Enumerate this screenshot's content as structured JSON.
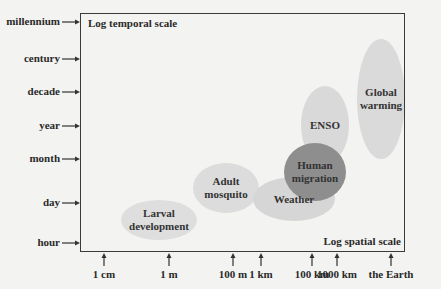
{
  "chart_data": {
    "type": "diagram",
    "title": "",
    "xlabel": "Log spatial scale",
    "ylabel": "Log temporal scale",
    "x_ticks": [
      {
        "label": "1 cm",
        "x": 104
      },
      {
        "label": "1 m",
        "x": 169
      },
      {
        "label": "100 m",
        "x": 233
      },
      {
        "label": "1 km",
        "x": 261
      },
      {
        "label": "100 km",
        "x": 312
      },
      {
        "label": "1000 km",
        "x": 337
      },
      {
        "label": "the Earth",
        "x": 391
      }
    ],
    "y_ticks": [
      {
        "label": "millennium",
        "y": 22
      },
      {
        "label": "century",
        "y": 59
      },
      {
        "label": "decade",
        "y": 92
      },
      {
        "label": "year",
        "y": 126
      },
      {
        "label": "month",
        "y": 159
      },
      {
        "label": "day",
        "y": 203
      },
      {
        "label": "hour",
        "y": 243
      }
    ],
    "regions": [
      {
        "label": "Larval development",
        "lines": [
          "Larval",
          "development"
        ],
        "cx": 159,
        "cy": 220,
        "rx": 38,
        "ry": 20,
        "fill": "#dedede"
      },
      {
        "label": "Adult mosquito",
        "lines": [
          "Adult",
          "mosquito"
        ],
        "cx": 226,
        "cy": 188,
        "rx": 33,
        "ry": 25,
        "fill": "#dcdcdc"
      },
      {
        "label": "Weather",
        "lines": [
          "Weather"
        ],
        "cx": 294,
        "cy": 199,
        "rx": 41,
        "ry": 22,
        "fill": "#d6d6d6"
      },
      {
        "label": "ENSO",
        "lines": [
          "ENSO"
        ],
        "cx": 325,
        "cy": 125,
        "rx": 24,
        "ry": 39,
        "fill": "#d9d9d9"
      },
      {
        "label": "Global warming",
        "lines": [
          "Global",
          "warming"
        ],
        "cx": 381,
        "cy": 99,
        "rx": 24,
        "ry": 60,
        "fill": "#dadada"
      },
      {
        "label": "Human migration",
        "lines": [
          "Human",
          "migration"
        ],
        "cx": 315,
        "cy": 172,
        "rx": 31,
        "ry": 29,
        "fill": "#8e8e8e"
      }
    ]
  }
}
